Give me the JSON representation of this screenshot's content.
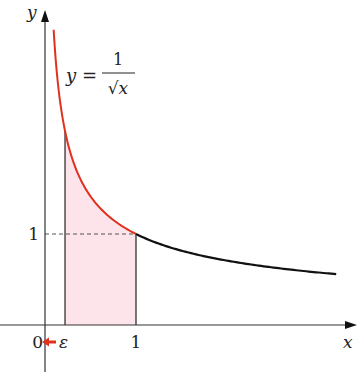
{
  "chart_data": {
    "type": "area",
    "title": "",
    "function_label": {
      "lhs": "y =",
      "numerator": "1",
      "denominator": "√x"
    },
    "xlabel": "x",
    "ylabel": "y",
    "xlim": [
      -0.5,
      3.4
    ],
    "ylim": [
      -0.5,
      3.5
    ],
    "x_ticks": [
      {
        "value": 0,
        "label": "0"
      },
      {
        "value": 1,
        "label": "1"
      }
    ],
    "y_ticks": [
      {
        "value": 1,
        "label": "1"
      }
    ],
    "epsilon": {
      "value": 0.22,
      "label": "ε",
      "arrow_direction": "left",
      "arrow_color": "#e0301e"
    },
    "series": [
      {
        "name": "y = 1/√x on [x0, 1]",
        "function": "1/sqrt(x)",
        "x_range": [
          0.095,
          1
        ],
        "color": "#e0301e"
      },
      {
        "name": "y = 1/√x on [1, 3.2]",
        "function": "1/sqrt(x)",
        "x_range": [
          1,
          3.2
        ],
        "color": "#111111"
      }
    ],
    "shaded_region": {
      "x_range": [
        0.22,
        1
      ],
      "under": "1/sqrt(x)",
      "fill": "#fde4ea"
    },
    "guides": [
      {
        "type": "dashed-horizontal",
        "y": 1,
        "x_range": [
          0,
          1
        ]
      }
    ],
    "vertical_lines": [
      0.22,
      1
    ],
    "grid": false
  }
}
